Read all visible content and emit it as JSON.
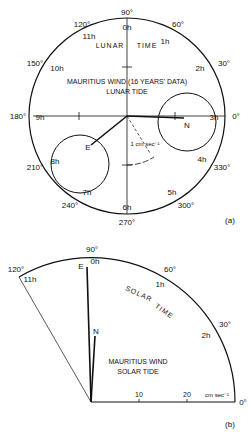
{
  "figure_a": {
    "panel_label": "(a)",
    "title_line1": "MAURITIUS WIND (16 YEARS' DATA)",
    "title_line2": "LUNAR TIDE",
    "time_label_left": "LUNAR",
    "time_label_right": "TIME",
    "scale_label": "1 cm sec⁻¹",
    "degree_labels": {
      "d0": "0°",
      "d30": "30°",
      "d60": "60°",
      "d90": "90°",
      "d120": "120°",
      "d150": "150°",
      "d180": "180°",
      "d210": "210°",
      "d240": "240°",
      "d270": "270°",
      "d300": "300°",
      "d330": "330°"
    },
    "hour_labels": {
      "h0": "0h",
      "h1": "1h",
      "h2": "2h",
      "h3": "3h",
      "h4": "4h",
      "h5": "5h",
      "h6": "6h",
      "h7": "7h",
      "h8": "8h",
      "h9": "9h",
      "h10": "10h",
      "h11": "11h"
    },
    "vectors": {
      "E": "E",
      "N": "N"
    }
  },
  "figure_b": {
    "panel_label": "(b)",
    "title_line1": "MAURITIUS WIND",
    "title_line2": "SOLAR TIDE",
    "time_label_left": "SOLAR",
    "time_label_right": "TIME",
    "degree_labels": {
      "d0": "0°",
      "d30": "30°",
      "d60": "60°",
      "d90": "90°",
      "d120": "120°"
    },
    "hour_labels": {
      "h0": "0h",
      "h1": "1h",
      "h2": "2h",
      "h11": "11h"
    },
    "axis_ticks": {
      "t10": "10",
      "t20": "20",
      "unit": "cm sec⁻¹"
    },
    "vectors": {
      "E": "E",
      "N": "N"
    }
  }
}
